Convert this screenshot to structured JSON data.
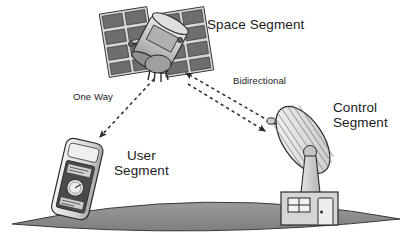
{
  "diagram": {
    "background_color": "#ffffff",
    "text_color": "#1a1a1a",
    "nodes": [
      {
        "id": "space-segment",
        "label": "Space Segment",
        "icon": "satellite-icon",
        "description": "Satellite with two solar panel arrays"
      },
      {
        "id": "control-segment",
        "label": "Control\nSegment",
        "icon": "satellite-dish-icon",
        "description": "Parabolic dish antenna on ground station building"
      },
      {
        "id": "user-segment",
        "label": "User\nSegment",
        "icon": "gps-receiver-icon",
        "description": "Handheld GPS receiver"
      }
    ],
    "links": [
      {
        "id": "link-one-way",
        "label": "One Way",
        "from": "space-segment",
        "to": "user-segment",
        "style": "dashed",
        "direction": "one-way"
      },
      {
        "id": "link-bidirectional",
        "label": "Bidirectional",
        "from": "space-segment",
        "to": "control-segment",
        "style": "dashed",
        "direction": "bidirectional"
      }
    ],
    "ground": {
      "id": "ground-ellipse",
      "shape": "ellipse",
      "fill_color": "#8d8d8d"
    },
    "colors": {
      "solar_panel_dark": "#6e6e6e",
      "solar_panel_frame": "#d8d8d8",
      "satellite_body": "#c9c9c9",
      "dish_light": "#ededed",
      "dish_rib": "#6a6a6a",
      "building_wall": "#d5d5d5",
      "device_body": "#e2e2e2",
      "device_screen": "#4a4a4a",
      "outline": "#2b2b2b"
    }
  }
}
